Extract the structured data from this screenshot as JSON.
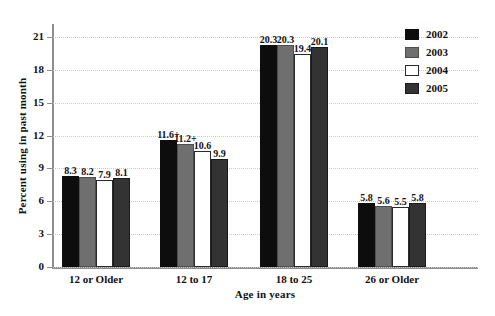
{
  "chart_data": {
    "type": "bar",
    "title": "",
    "xlabel": "Age in years",
    "ylabel": "Percent using in past month",
    "ylim": [
      0,
      22
    ],
    "yticks": [
      0,
      3,
      6,
      9,
      12,
      15,
      18,
      21
    ],
    "ytick_labels": [
      "0",
      "3",
      "6",
      "9",
      "12",
      "15",
      "18",
      "21"
    ],
    "grid": true,
    "legend_position": "top-right",
    "categories": [
      "12 or Older",
      "12 to 17",
      "18 to 25",
      "26 or Older"
    ],
    "series": [
      {
        "name": "2002",
        "color": "#0d0d0d",
        "values": [
          8.3,
          11.6,
          20.3,
          5.8
        ],
        "labels": [
          "8.3",
          "11.6+",
          "20.3",
          "5.8"
        ]
      },
      {
        "name": "2003",
        "color": "#6f6f6f",
        "values": [
          8.2,
          11.2,
          20.3,
          5.6
        ],
        "labels": [
          "8.2",
          "11.2+",
          "20.3",
          "5.6"
        ]
      },
      {
        "name": "2004",
        "color": "#ffffff",
        "values": [
          7.9,
          10.6,
          19.4,
          5.5
        ],
        "labels": [
          "7.9",
          "10.6",
          "19.4",
          "5.5"
        ]
      },
      {
        "name": "2005",
        "color": "#333333",
        "values": [
          8.1,
          9.9,
          20.1,
          5.8
        ],
        "labels": [
          "8.1",
          "9.9",
          "20.1",
          "5.8"
        ]
      }
    ]
  },
  "legend": {
    "entries": [
      {
        "label": "2002"
      },
      {
        "label": "2003"
      },
      {
        "label": "2004"
      },
      {
        "label": "2005"
      }
    ]
  },
  "colors": {
    "series_2002": "#0d0d0d",
    "series_2003": "#6f6f6f",
    "series_2004": "#ffffff",
    "series_2005": "#333333",
    "axis": "#8d8d8d",
    "gridline": "#c9c9c9",
    "text": "#111111"
  }
}
